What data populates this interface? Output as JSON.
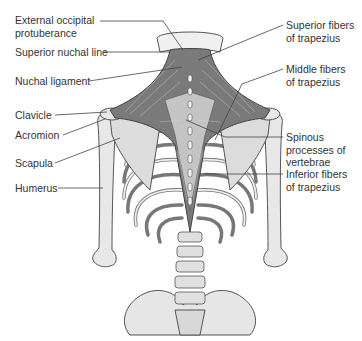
{
  "figure": {
    "colors": {
      "muscle": "#6b6b6b",
      "muscle_light": "#b8b8b8",
      "bone": "#e6e6e6",
      "bone_outline": "#555555",
      "leader": "#444444",
      "text": "#333333",
      "background": "#ffffff"
    }
  },
  "labels_left": [
    {
      "id": "external-occipital-protuberance",
      "text": "External occipital\nprotuberance",
      "x": 15,
      "y": 18,
      "anchor": [
        60,
        21
      ],
      "target": [
        183,
        50
      ]
    },
    {
      "id": "superior-nuchal-line",
      "text": "Superior nuchal line",
      "x": 15,
      "y": 46,
      "anchor": [
        103,
        52
      ],
      "target": [
        170,
        52
      ]
    },
    {
      "id": "nuchal-ligament",
      "text": "Nuchal ligament",
      "x": 15,
      "y": 75,
      "anchor": [
        88,
        81
      ],
      "target": [
        182,
        67
      ]
    },
    {
      "id": "clavicle",
      "text": "Clavicle",
      "x": 15,
      "y": 109,
      "anchor": [
        55,
        115
      ],
      "target": [
        107,
        112
      ]
    },
    {
      "id": "acromion",
      "text": "Acromion",
      "x": 15,
      "y": 129,
      "anchor": [
        63,
        135
      ],
      "target": [
        105,
        119
      ]
    },
    {
      "id": "scapula",
      "text": "Scapula",
      "x": 15,
      "y": 157,
      "anchor": [
        55,
        163
      ],
      "target": [
        120,
        138
      ]
    },
    {
      "id": "humerus",
      "text": "Humerus",
      "x": 15,
      "y": 182,
      "anchor": [
        58,
        188
      ],
      "target": [
        103,
        188
      ]
    }
  ],
  "labels_right": [
    {
      "id": "superior-fibers-of-trapezius",
      "text": "Superior fibers\nof trapezius",
      "x": 286,
      "y": 19,
      "anchor": [
        283,
        25
      ],
      "target": [
        198,
        60
      ]
    },
    {
      "id": "middle-fibers-of-trapezius",
      "text": "Middle fibers\nof trapezius",
      "x": 286,
      "y": 63,
      "anchor": [
        283,
        69
      ],
      "target": [
        242,
        84
      ]
    },
    {
      "id": "spinous-processes-of-vertebrae",
      "text": "Spinous\nprocesses of\nvertebrae",
      "x": 286,
      "y": 132,
      "anchor": [
        283,
        137
      ],
      "target": [
        186,
        138
      ]
    },
    {
      "id": "inferior-fibers-of-trapezius",
      "text": "Inferior fibers\nof trapezius",
      "x": 286,
      "y": 169,
      "anchor": [
        283,
        174
      ],
      "target": [
        205,
        174
      ]
    }
  ]
}
